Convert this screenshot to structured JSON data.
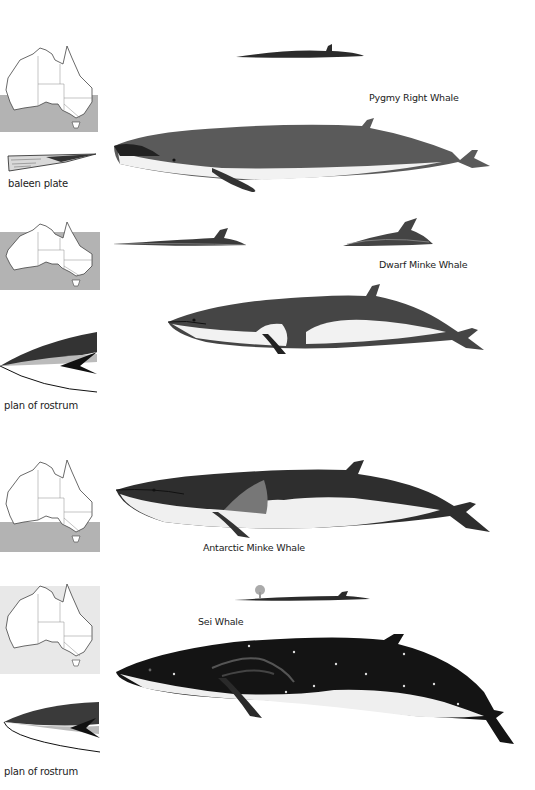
{
  "colors": {
    "range_shading": "#b3b3b3",
    "map_panel_light": "#e8e8e8",
    "whale_dark": "#2b2b2b",
    "whale_grey": "#5a5a5a",
    "belly": "#f2f2f2"
  },
  "sections": [
    {
      "species": "Pygmy Right Whale",
      "map": {
        "icon": "australia-map-icon",
        "range": "southern coastal waters"
      },
      "detail_label": "baleen plate",
      "detail_icon": "baleen-plate-icon",
      "silhouettes": [
        "surface-profile-icon"
      ]
    },
    {
      "species": "Dwarf Minke Whale",
      "map": {
        "icon": "australia-map-icon",
        "range": "surrounding waters (west, south, east)"
      },
      "detail_label": "plan of rostrum",
      "detail_icon": "rostrum-plan-icon",
      "silhouettes": [
        "surface-profile-icon",
        "dorsal-fin-profile-icon"
      ]
    },
    {
      "species": "Antarctic Minke Whale",
      "map": {
        "icon": "australia-map-icon",
        "range": "southern waters"
      },
      "detail_label": "",
      "detail_icon": "",
      "silhouettes": []
    },
    {
      "species": "Sei Whale",
      "map": {
        "icon": "australia-map-icon",
        "range": "all surrounding waters (light)"
      },
      "detail_label": "plan of rostrum",
      "detail_icon": "rostrum-plan-icon",
      "silhouettes": [
        "surface-blow-profile-icon"
      ]
    }
  ]
}
